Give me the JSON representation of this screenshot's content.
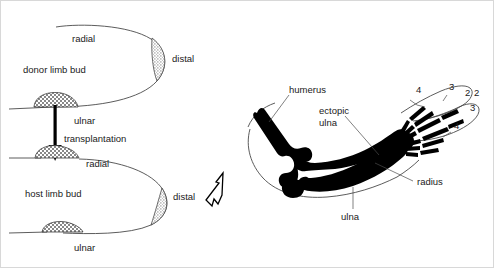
{
  "left_panel": {
    "donor": {
      "name": "donor limb bud",
      "label": "donor limb bud",
      "radial_label": "radial",
      "ulnar_label": "ulnar",
      "distal_label": "distal"
    },
    "host": {
      "name": "host limb bud",
      "label": "host limb bud",
      "radial_label": "radial",
      "ulnar_label": "ulnar",
      "distal_label": "distal"
    },
    "transplantation_label": "transplantation",
    "graft_icon": "crosshatched-tissue-graft",
    "aer_icon": "stippled-apical-ectodermal-ridge",
    "arrow_icon": "down-arrow",
    "result_arrow_icon": "hollow-arrow-up-right"
  },
  "right_panel": {
    "name": "resulting limb skeleton",
    "labels": {
      "humerus": "humerus",
      "ectopic_ulna": "ectopic\nulna",
      "ectopic_ulna_line1": "ectopic",
      "ectopic_ulna_line2": "ulna",
      "radius": "radius",
      "ulna": "ulna"
    },
    "digits": [
      {
        "id": "d1",
        "label": "4",
        "x": 415,
        "y": 92
      },
      {
        "id": "d2",
        "label": "3",
        "x": 448,
        "y": 89
      },
      {
        "id": "d3",
        "label": "2",
        "x": 464,
        "y": 95
      },
      {
        "id": "d4",
        "label": "2",
        "x": 473,
        "y": 95
      },
      {
        "id": "d5",
        "label": "3",
        "x": 469,
        "y": 110
      },
      {
        "id": "d6",
        "label": "4",
        "x": 453,
        "y": 128
      }
    ]
  },
  "colors": {
    "bone": "#000000",
    "outline": "#4a4a4a",
    "text": "#1a1a1a",
    "background": "#ffffff",
    "border": "#d8d8d8"
  }
}
